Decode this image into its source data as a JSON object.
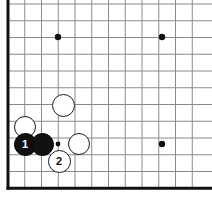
{
  "diagram": {
    "kind": "go-board-diagram",
    "board": {
      "width_px": 212,
      "height_px": 204,
      "background_color": "#ffffff",
      "line_color": "#8a8a8a",
      "edge_color": "#111111",
      "line_width_px": 1,
      "edge_width_px": 3,
      "spacing_px": 16.75,
      "origin_x_px": 8,
      "origin_y_px": 4,
      "columns": 12,
      "rows": 12,
      "edges_drawn": [
        "left",
        "bottom"
      ],
      "x_lines": [
        8,
        24.75,
        41.5,
        58.25,
        75,
        91.75,
        108.5,
        125.25,
        142,
        158.75,
        175.5,
        192.25
      ],
      "y_lines": [
        4,
        20.75,
        37.5,
        54.25,
        71,
        87.75,
        104.5,
        121.25,
        138,
        154.75,
        171.5,
        188.25
      ]
    },
    "star_points": [
      {
        "name": "star-point-upper-left",
        "x": 58,
        "y": 37,
        "radius": 3.2
      },
      {
        "name": "star-point-upper-right",
        "x": 162,
        "y": 37,
        "radius": 3.2
      },
      {
        "name": "star-point-lower-right",
        "x": 162,
        "y": 144,
        "radius": 3.2
      },
      {
        "name": "star-point-lower-left",
        "x": 58,
        "y": 144,
        "radius": 2.4
      }
    ],
    "stones": [
      {
        "name": "white-stone-upper",
        "color": "white",
        "label": "",
        "x": 63,
        "y": 105,
        "radius": 11.5
      },
      {
        "name": "white-stone-left",
        "color": "white",
        "label": "",
        "x": 25,
        "y": 127,
        "radius": 11.0
      },
      {
        "name": "black-stone-move-1",
        "color": "black",
        "label": "1",
        "x": 25,
        "y": 144,
        "radius": 11.5
      },
      {
        "name": "black-stone-plain",
        "color": "black",
        "label": "",
        "x": 42,
        "y": 144,
        "radius": 11.5
      },
      {
        "name": "white-stone-right",
        "color": "white",
        "label": "",
        "x": 79,
        "y": 144,
        "radius": 11.0
      },
      {
        "name": "white-stone-move-2",
        "color": "white",
        "label": "2",
        "x": 59,
        "y": 161,
        "radius": 11.5
      }
    ],
    "move_labels": {
      "black_move": "1",
      "white_move": "2"
    }
  }
}
